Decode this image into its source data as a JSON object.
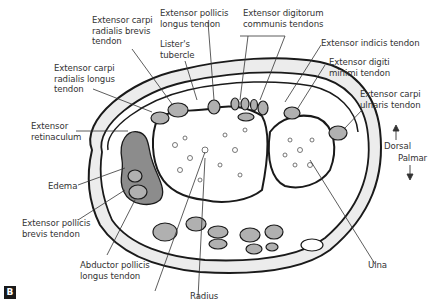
{
  "figure": {
    "panel_label": "B",
    "orientation": {
      "dorsal": "Dorsal",
      "palmar": "Palmar"
    },
    "colors": {
      "outline": "#1a1a1a",
      "tendon_fill": "#b0b0b0",
      "edema_fill": "#8c8c8c",
      "bone_fill": "#ffffff",
      "soft_tissue": "#e6e6e6"
    },
    "labels": {
      "ecrb": "Extensor carpi\nradialis brevis\ntendon",
      "epl": "Extensor pollicis\nlongus tendon",
      "edc": "Extensor digitorum\ncommunis tendons",
      "listers": "Lister's\ntubercle",
      "ei": "Extensor indicis tendon",
      "edm": "Extensor digiti\nminimi tendon",
      "ecrl": "Extensor carpi\nradialis longus\ntendon",
      "ecu": "Extensor carpi\nulnaris tendon",
      "retinaculum": "Extensor\nretinaculum",
      "edema": "Edema",
      "epb": "Extensor pollicis\nbrevis tendon",
      "apl": "Abductor pollicis\nlongus tendon",
      "ulna": "Ulna",
      "radius": "Radius"
    }
  }
}
